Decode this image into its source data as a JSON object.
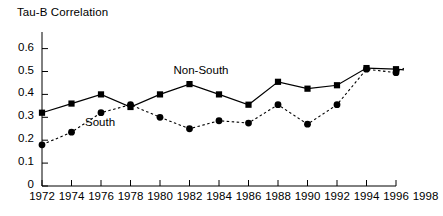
{
  "chart_data": {
    "type": "line",
    "title": "",
    "ylabel": "Tau-B Correlation",
    "xlabel": "",
    "x": [
      1972,
      1974,
      1976,
      1978,
      1980,
      1982,
      1984,
      1986,
      1988,
      1990,
      1992,
      1994,
      1996,
      1998
    ],
    "xtick_labels": [
      "1972",
      "1974",
      "1976",
      "1978",
      "1980",
      "1982",
      "1984",
      "1986",
      "1988",
      "1990",
      "1992",
      "1994",
      "1996",
      "1998"
    ],
    "ytick_labels": [
      "0",
      "0.1",
      "0.2",
      "0.3",
      "0.4",
      "0.5",
      "0.6"
    ],
    "ytick_values": [
      0,
      0.1,
      0.2,
      0.3,
      0.4,
      0.5,
      0.6
    ],
    "ylim": [
      0,
      0.6
    ],
    "xlim": [
      1972,
      1998
    ],
    "grid": false,
    "legend_position": "inline-annotation",
    "series": [
      {
        "name": "Non-South",
        "line_style": "solid",
        "marker": "square",
        "color": "#000000",
        "values": [
          0.32,
          0.36,
          0.4,
          0.345,
          0.4,
          0.445,
          0.4,
          0.355,
          0.455,
          0.425,
          0.44,
          0.515,
          0.51,
          0.5
        ]
      },
      {
        "name": "South",
        "line_style": "dashed",
        "marker": "circle",
        "color": "#000000",
        "values": [
          0.18,
          0.235,
          0.32,
          0.355,
          0.3,
          0.25,
          0.285,
          0.275,
          0.355,
          0.27,
          0.355,
          0.51,
          0.495,
          0.565
        ]
      }
    ],
    "annotations": [
      {
        "text": "Non-South",
        "x": 1982,
        "y": 0.5
      },
      {
        "text": "South",
        "x": 1976,
        "y": 0.27
      }
    ]
  },
  "axis": {
    "title": "Tau-B Correlation"
  }
}
